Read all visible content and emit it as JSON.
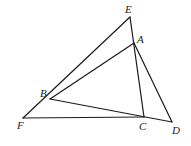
{
  "figure": {
    "points": {
      "E": {
        "x": 130,
        "y": 17,
        "label": "E",
        "lx": 125,
        "ly": 13
      },
      "A": {
        "x": 134,
        "y": 43,
        "label": "A",
        "lx": 137,
        "ly": 43
      },
      "B": {
        "x": 50,
        "y": 99,
        "label": "B",
        "lx": 40,
        "ly": 97
      },
      "F": {
        "x": 23,
        "y": 118,
        "label": "F",
        "lx": 17,
        "ly": 129
      },
      "C": {
        "x": 144,
        "y": 117,
        "label": "C",
        "lx": 139,
        "ly": 130
      },
      "D": {
        "x": 172,
        "y": 122,
        "label": "D",
        "lx": 172,
        "ly": 134
      }
    },
    "segments": [
      [
        "F",
        "E"
      ],
      [
        "E",
        "C"
      ],
      [
        "B",
        "A"
      ],
      [
        "A",
        "D"
      ],
      [
        "B",
        "D"
      ],
      [
        "F",
        "C"
      ]
    ]
  }
}
